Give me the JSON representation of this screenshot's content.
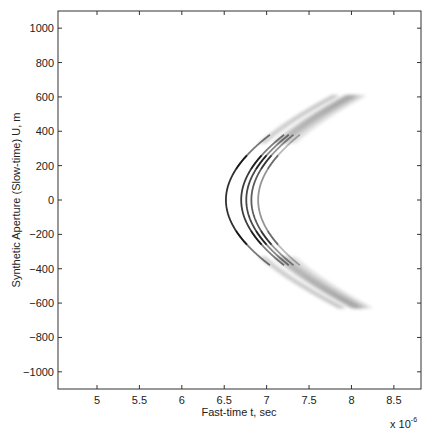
{
  "chart_data": {
    "type": "heatmap",
    "title": "",
    "xlabel": "Fast-time t, sec",
    "ylabel": "Synthetic Aperture (Slow-time) U, m",
    "x_multiplier_label": "x 10",
    "x_multiplier_exponent": "-6",
    "xlim": [
      4.54,
      8.82
    ],
    "ylim": [
      -1100,
      1100
    ],
    "x_ticks": [
      5,
      5.5,
      6,
      6.5,
      7,
      7.5,
      8,
      8.5
    ],
    "x_tick_labels": [
      "5",
      "5.5",
      "6",
      "6.5",
      "7",
      "7.5",
      "8",
      "8.5"
    ],
    "y_ticks": [
      1000,
      800,
      600,
      400,
      200,
      0,
      -200,
      -400,
      -600,
      -800,
      -1000
    ],
    "y_tick_labels": [
      "1000",
      "800",
      "600",
      "400",
      "200",
      "0",
      "−200",
      "−400",
      "−600",
      "−800",
      "−1000"
    ],
    "grid": false,
    "colormap": "gray-inverted",
    "series": [
      {
        "name": "target-1",
        "t0": 6.52,
        "intensity": 0.95
      },
      {
        "name": "target-2",
        "t0": 6.7,
        "intensity": 0.9
      },
      {
        "name": "target-3",
        "t0": 6.76,
        "intensity": 0.85
      },
      {
        "name": "target-4",
        "t0": 6.82,
        "intensity": 0.75
      },
      {
        "name": "target-5",
        "t0": 6.9,
        "intensity": 0.5
      }
    ],
    "curve_model": "t(U) = sqrt(t0^2 + (0.00698*U)^2)",
    "u_extent": [
      -630,
      610
    ]
  }
}
